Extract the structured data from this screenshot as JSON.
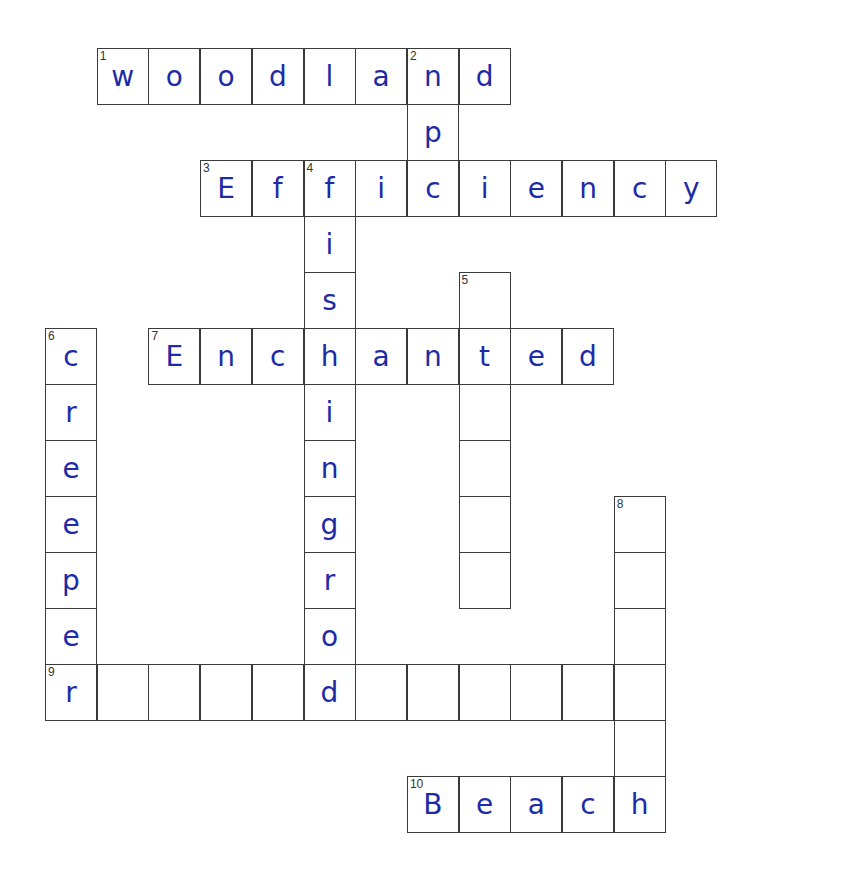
{
  "puzzle": {
    "title": "Crossword",
    "ink_color": "#1d2ba6",
    "grid_origin": {
      "x": 45,
      "y": 48
    },
    "cell_size": {
      "w": 51.7,
      "h": 56
    },
    "cells": [
      {
        "r": 0,
        "c": 1,
        "num": "1",
        "letter": "w"
      },
      {
        "r": 0,
        "c": 2,
        "letter": "o"
      },
      {
        "r": 0,
        "c": 3,
        "letter": "o"
      },
      {
        "r": 0,
        "c": 4,
        "letter": "d"
      },
      {
        "r": 0,
        "c": 5,
        "letter": "l"
      },
      {
        "r": 0,
        "c": 6,
        "letter": "a"
      },
      {
        "r": 0,
        "c": 7,
        "num": "2",
        "letter": "n"
      },
      {
        "r": 0,
        "c": 8,
        "letter": "d"
      },
      {
        "r": 1,
        "c": 7,
        "letter": "p"
      },
      {
        "r": 2,
        "c": 3,
        "num": "3",
        "letter": "E"
      },
      {
        "r": 2,
        "c": 4,
        "letter": "f"
      },
      {
        "r": 2,
        "c": 5,
        "num": "4",
        "letter": "f"
      },
      {
        "r": 2,
        "c": 6,
        "letter": "i"
      },
      {
        "r": 2,
        "c": 7,
        "letter": "c"
      },
      {
        "r": 2,
        "c": 8,
        "letter": "i"
      },
      {
        "r": 2,
        "c": 9,
        "letter": "e"
      },
      {
        "r": 2,
        "c": 10,
        "letter": "n"
      },
      {
        "r": 2,
        "c": 11,
        "letter": "c"
      },
      {
        "r": 2,
        "c": 12,
        "letter": "y"
      },
      {
        "r": 3,
        "c": 5,
        "letter": "i"
      },
      {
        "r": 4,
        "c": 5,
        "letter": "s"
      },
      {
        "r": 4,
        "c": 8,
        "num": "5",
        "letter": ""
      },
      {
        "r": 5,
        "c": 0,
        "num": "6",
        "letter": "c"
      },
      {
        "r": 5,
        "c": 2,
        "num": "7",
        "letter": "E"
      },
      {
        "r": 5,
        "c": 3,
        "letter": "n"
      },
      {
        "r": 5,
        "c": 4,
        "letter": "c"
      },
      {
        "r": 5,
        "c": 5,
        "letter": "h"
      },
      {
        "r": 5,
        "c": 6,
        "letter": "a"
      },
      {
        "r": 5,
        "c": 7,
        "letter": "n"
      },
      {
        "r": 5,
        "c": 8,
        "letter": "t"
      },
      {
        "r": 5,
        "c": 9,
        "letter": "e"
      },
      {
        "r": 5,
        "c": 10,
        "letter": "d"
      },
      {
        "r": 6,
        "c": 0,
        "letter": "r"
      },
      {
        "r": 6,
        "c": 5,
        "letter": "i"
      },
      {
        "r": 6,
        "c": 8,
        "letter": ""
      },
      {
        "r": 7,
        "c": 0,
        "letter": "e"
      },
      {
        "r": 7,
        "c": 5,
        "letter": "n"
      },
      {
        "r": 7,
        "c": 8,
        "letter": ""
      },
      {
        "r": 8,
        "c": 0,
        "letter": "e"
      },
      {
        "r": 8,
        "c": 5,
        "letter": "g"
      },
      {
        "r": 8,
        "c": 8,
        "letter": ""
      },
      {
        "r": 8,
        "c": 11,
        "num": "8",
        "letter": ""
      },
      {
        "r": 9,
        "c": 0,
        "letter": "p"
      },
      {
        "r": 9,
        "c": 5,
        "letter": "r"
      },
      {
        "r": 9,
        "c": 8,
        "letter": ""
      },
      {
        "r": 9,
        "c": 11,
        "letter": ""
      },
      {
        "r": 10,
        "c": 0,
        "letter": "e"
      },
      {
        "r": 10,
        "c": 5,
        "letter": "o"
      },
      {
        "r": 10,
        "c": 11,
        "letter": ""
      },
      {
        "r": 11,
        "c": 0,
        "num": "9",
        "letter": "r"
      },
      {
        "r": 11,
        "c": 1,
        "letter": ""
      },
      {
        "r": 11,
        "c": 2,
        "letter": ""
      },
      {
        "r": 11,
        "c": 3,
        "letter": ""
      },
      {
        "r": 11,
        "c": 4,
        "letter": ""
      },
      {
        "r": 11,
        "c": 5,
        "letter": "d"
      },
      {
        "r": 11,
        "c": 6,
        "letter": ""
      },
      {
        "r": 11,
        "c": 7,
        "letter": ""
      },
      {
        "r": 11,
        "c": 8,
        "letter": ""
      },
      {
        "r": 11,
        "c": 9,
        "letter": ""
      },
      {
        "r": 11,
        "c": 10,
        "letter": ""
      },
      {
        "r": 11,
        "c": 11,
        "letter": ""
      },
      {
        "r": 12,
        "c": 11,
        "letter": ""
      },
      {
        "r": 13,
        "c": 7,
        "num": "10",
        "letter": "B"
      },
      {
        "r": 13,
        "c": 8,
        "letter": "e"
      },
      {
        "r": 13,
        "c": 9,
        "letter": "a"
      },
      {
        "r": 13,
        "c": 10,
        "letter": "c"
      },
      {
        "r": 13,
        "c": 11,
        "letter": "h"
      }
    ],
    "entries": {
      "across": [
        {
          "num": "1",
          "answer": "woodland"
        },
        {
          "num": "3",
          "answer": "Efficiency"
        },
        {
          "num": "7",
          "answer": "Enchanted"
        },
        {
          "num": "9",
          "answer": "r____d______"
        },
        {
          "num": "10",
          "answer": "Beach"
        }
      ],
      "down": [
        {
          "num": "2",
          "answer": "np"
        },
        {
          "num": "4",
          "answer": "fishingrod"
        },
        {
          "num": "5",
          "answer": "_t____"
        },
        {
          "num": "6",
          "answer": "creeper"
        },
        {
          "num": "8",
          "answer": "______"
        }
      ]
    }
  }
}
